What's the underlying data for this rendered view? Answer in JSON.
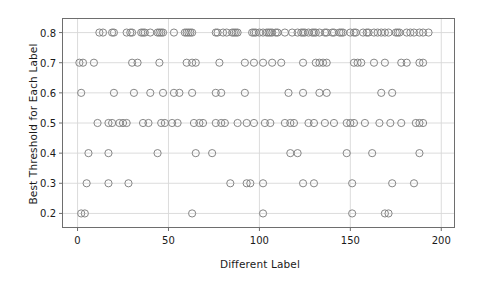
{
  "chart_data": {
    "type": "scatter",
    "title": "",
    "xlabel": "Different Label",
    "ylabel": "Best Threshold for Each Label",
    "xlim": [
      -8,
      207
    ],
    "ylim": [
      0.155,
      0.845
    ],
    "xticks": [
      0,
      50,
      100,
      150,
      200
    ],
    "xticklabels": [
      "0",
      "50",
      "100",
      "150",
      "200"
    ],
    "yticks": [
      0.2,
      0.3,
      0.4,
      0.5,
      0.6,
      0.7,
      0.8
    ],
    "yticklabels": [
      "0.2",
      "0.3",
      "0.4",
      "0.5",
      "0.6",
      "0.7",
      "0.8"
    ],
    "grid": true,
    "grid_color": "#d8d8d8",
    "legend": null,
    "marker": "open-circle",
    "marker_edge_color": "#808080",
    "marker_face_color": "none",
    "marker_size": 4.6,
    "series": [
      {
        "name": "Best threshold per label",
        "x": [
          12,
          14,
          19,
          20,
          27,
          29,
          30,
          35,
          36,
          37,
          40,
          44,
          45,
          46,
          47,
          53,
          59,
          60,
          61,
          62,
          63,
          76,
          77,
          80,
          82,
          85,
          86,
          87,
          88,
          96,
          97,
          98,
          100,
          102,
          104,
          105,
          106,
          107,
          109,
          110,
          114,
          118,
          121,
          123,
          124,
          125,
          127,
          129,
          130,
          131,
          133,
          136,
          137,
          140,
          141,
          144,
          145,
          146,
          150,
          152,
          153,
          157,
          159,
          160,
          163,
          165,
          167,
          169,
          171,
          175,
          176,
          177,
          181,
          183,
          185,
          188,
          190,
          193
        ],
        "y_value": 0.8,
        "y": [
          0.8,
          0.8,
          0.8,
          0.8,
          0.8,
          0.8,
          0.8,
          0.8,
          0.8,
          0.8,
          0.8,
          0.8,
          0.8,
          0.8,
          0.8,
          0.8,
          0.8,
          0.8,
          0.8,
          0.8,
          0.8,
          0.8,
          0.8,
          0.8,
          0.8,
          0.8,
          0.8,
          0.8,
          0.8,
          0.8,
          0.8,
          0.8,
          0.8,
          0.8,
          0.8,
          0.8,
          0.8,
          0.8,
          0.8,
          0.8,
          0.8,
          0.8,
          0.8,
          0.8,
          0.8,
          0.8,
          0.8,
          0.8,
          0.8,
          0.8,
          0.8,
          0.8,
          0.8,
          0.8,
          0.8,
          0.8,
          0.8,
          0.8,
          0.8,
          0.8,
          0.8,
          0.8,
          0.8,
          0.8,
          0.8,
          0.8,
          0.8,
          0.8,
          0.8,
          0.8,
          0.8,
          0.8,
          0.8,
          0.8,
          0.8,
          0.8,
          0.8,
          0.8
        ]
      }
    ],
    "points": [
      {
        "x": 1,
        "y": 0.7
      },
      {
        "x": 3,
        "y": 0.7
      },
      {
        "x": 9,
        "y": 0.7
      },
      {
        "x": 30,
        "y": 0.7
      },
      {
        "x": 33,
        "y": 0.7
      },
      {
        "x": 45,
        "y": 0.7
      },
      {
        "x": 60,
        "y": 0.7
      },
      {
        "x": 63,
        "y": 0.7
      },
      {
        "x": 65,
        "y": 0.7
      },
      {
        "x": 78,
        "y": 0.7
      },
      {
        "x": 92,
        "y": 0.7
      },
      {
        "x": 97,
        "y": 0.7
      },
      {
        "x": 102,
        "y": 0.7
      },
      {
        "x": 107,
        "y": 0.7
      },
      {
        "x": 112,
        "y": 0.7
      },
      {
        "x": 124,
        "y": 0.7
      },
      {
        "x": 131,
        "y": 0.7
      },
      {
        "x": 133,
        "y": 0.7
      },
      {
        "x": 135,
        "y": 0.7
      },
      {
        "x": 137,
        "y": 0.7
      },
      {
        "x": 152,
        "y": 0.7
      },
      {
        "x": 154,
        "y": 0.7
      },
      {
        "x": 156,
        "y": 0.7
      },
      {
        "x": 163,
        "y": 0.7
      },
      {
        "x": 169,
        "y": 0.7
      },
      {
        "x": 178,
        "y": 0.7
      },
      {
        "x": 181,
        "y": 0.7
      },
      {
        "x": 188,
        "y": 0.7
      },
      {
        "x": 190,
        "y": 0.7
      },
      {
        "x": 2,
        "y": 0.6
      },
      {
        "x": 20,
        "y": 0.6
      },
      {
        "x": 31,
        "y": 0.6
      },
      {
        "x": 40,
        "y": 0.6
      },
      {
        "x": 47,
        "y": 0.6
      },
      {
        "x": 53,
        "y": 0.6
      },
      {
        "x": 56,
        "y": 0.6
      },
      {
        "x": 63,
        "y": 0.6
      },
      {
        "x": 76,
        "y": 0.6
      },
      {
        "x": 79,
        "y": 0.6
      },
      {
        "x": 92,
        "y": 0.6
      },
      {
        "x": 116,
        "y": 0.6
      },
      {
        "x": 124,
        "y": 0.6
      },
      {
        "x": 133,
        "y": 0.6
      },
      {
        "x": 137,
        "y": 0.6
      },
      {
        "x": 167,
        "y": 0.6
      },
      {
        "x": 173,
        "y": 0.6
      },
      {
        "x": 11,
        "y": 0.5
      },
      {
        "x": 17,
        "y": 0.5
      },
      {
        "x": 19,
        "y": 0.5
      },
      {
        "x": 23,
        "y": 0.5
      },
      {
        "x": 25,
        "y": 0.5
      },
      {
        "x": 27,
        "y": 0.5
      },
      {
        "x": 36,
        "y": 0.5
      },
      {
        "x": 39,
        "y": 0.5
      },
      {
        "x": 46,
        "y": 0.5
      },
      {
        "x": 48,
        "y": 0.5
      },
      {
        "x": 52,
        "y": 0.5
      },
      {
        "x": 55,
        "y": 0.5
      },
      {
        "x": 64,
        "y": 0.5
      },
      {
        "x": 67,
        "y": 0.5
      },
      {
        "x": 69,
        "y": 0.5
      },
      {
        "x": 76,
        "y": 0.5
      },
      {
        "x": 79,
        "y": 0.5
      },
      {
        "x": 81,
        "y": 0.5
      },
      {
        "x": 88,
        "y": 0.5
      },
      {
        "x": 93,
        "y": 0.5
      },
      {
        "x": 97,
        "y": 0.5
      },
      {
        "x": 103,
        "y": 0.5
      },
      {
        "x": 106,
        "y": 0.5
      },
      {
        "x": 114,
        "y": 0.5
      },
      {
        "x": 117,
        "y": 0.5
      },
      {
        "x": 119,
        "y": 0.5
      },
      {
        "x": 127,
        "y": 0.5
      },
      {
        "x": 130,
        "y": 0.5
      },
      {
        "x": 136,
        "y": 0.5
      },
      {
        "x": 141,
        "y": 0.5
      },
      {
        "x": 148,
        "y": 0.5
      },
      {
        "x": 150,
        "y": 0.5
      },
      {
        "x": 152,
        "y": 0.5
      },
      {
        "x": 158,
        "y": 0.5
      },
      {
        "x": 166,
        "y": 0.5
      },
      {
        "x": 172,
        "y": 0.5
      },
      {
        "x": 178,
        "y": 0.5
      },
      {
        "x": 186,
        "y": 0.5
      },
      {
        "x": 188,
        "y": 0.5
      },
      {
        "x": 190,
        "y": 0.5
      },
      {
        "x": 6,
        "y": 0.4
      },
      {
        "x": 17,
        "y": 0.4
      },
      {
        "x": 44,
        "y": 0.4
      },
      {
        "x": 65,
        "y": 0.4
      },
      {
        "x": 74,
        "y": 0.4
      },
      {
        "x": 117,
        "y": 0.4
      },
      {
        "x": 121,
        "y": 0.4
      },
      {
        "x": 148,
        "y": 0.4
      },
      {
        "x": 162,
        "y": 0.4
      },
      {
        "x": 188,
        "y": 0.4
      },
      {
        "x": 5,
        "y": 0.3
      },
      {
        "x": 17,
        "y": 0.3
      },
      {
        "x": 28,
        "y": 0.3
      },
      {
        "x": 84,
        "y": 0.3
      },
      {
        "x": 93,
        "y": 0.3
      },
      {
        "x": 95,
        "y": 0.3
      },
      {
        "x": 102,
        "y": 0.3
      },
      {
        "x": 124,
        "y": 0.3
      },
      {
        "x": 130,
        "y": 0.3
      },
      {
        "x": 151,
        "y": 0.3
      },
      {
        "x": 173,
        "y": 0.3
      },
      {
        "x": 185,
        "y": 0.3
      },
      {
        "x": 2,
        "y": 0.2
      },
      {
        "x": 4,
        "y": 0.2
      },
      {
        "x": 63,
        "y": 0.2
      },
      {
        "x": 102,
        "y": 0.2
      },
      {
        "x": 151,
        "y": 0.2
      },
      {
        "x": 169,
        "y": 0.2
      },
      {
        "x": 171,
        "y": 0.2
      }
    ]
  }
}
